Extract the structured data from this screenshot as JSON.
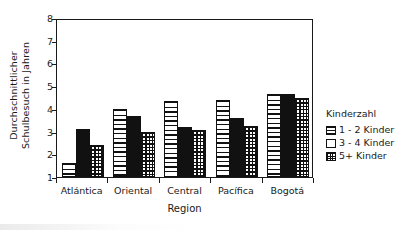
{
  "chart_data": {
    "type": "bar",
    "title": "",
    "xlabel": "Region",
    "ylabel_line1": "Durchschnittlicher",
    "ylabel_line2": "Schulbesuch in Jahren",
    "categories": [
      "Atlántica",
      "Oriental",
      "Central",
      "Pacífica",
      "Bogotá"
    ],
    "series": [
      {
        "name": "1 - 2 Kinder",
        "pattern": "horizontal-lines",
        "values": [
          1.6,
          4.0,
          4.35,
          4.4,
          4.65
        ]
      },
      {
        "name": "3 - 4 Kinder",
        "pattern": "solid-black",
        "values": [
          3.1,
          3.7,
          3.2,
          3.6,
          4.65
        ]
      },
      {
        "name": "5+ Kinder",
        "pattern": "grid-crosshatch",
        "values": [
          2.4,
          3.0,
          3.05,
          3.25,
          4.5
        ]
      }
    ],
    "ylim": [
      1,
      8
    ],
    "yticks": [
      1,
      2,
      3,
      4,
      5,
      6,
      7,
      8
    ],
    "ytick_labels": [
      "1",
      "2",
      "3",
      "4",
      "5",
      "6",
      "7",
      "8"
    ],
    "grid": false,
    "legend_position": "right",
    "legend_title": "Kinderzahl",
    "colors": {
      "ink": "#111111",
      "background": "#ffffff"
    }
  },
  "legend": {
    "title": "Kinderzahl",
    "items": [
      {
        "label": "1 - 2 Kinder"
      },
      {
        "label": "3 - 4 Kinder"
      },
      {
        "label": "5+ Kinder"
      }
    ]
  },
  "axes": {
    "x_title": "Region",
    "y_title_line1": "Durchschnittlicher",
    "y_title_line2": "Schulbesuch in Jahren"
  }
}
